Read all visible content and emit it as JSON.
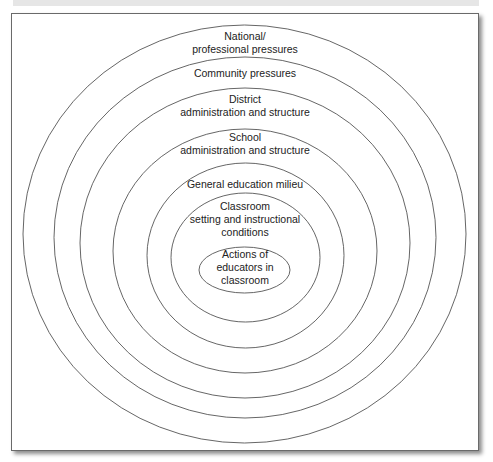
{
  "diagram": {
    "type": "nested-ellipses",
    "line_color": "#555555",
    "layers": [
      {
        "id": "national",
        "lines": [
          "National/",
          "professional pressures"
        ],
        "cx": 244.5,
        "cy": 234,
        "rx": 221.5,
        "ry": 209,
        "label_top": 30
      },
      {
        "id": "community",
        "lines": [
          "Community pressures"
        ],
        "cx": 245,
        "cy": 237.5,
        "rx": 191,
        "ry": 180.5,
        "label_top": 67
      },
      {
        "id": "district",
        "lines": [
          "District",
          "administration and structure"
        ],
        "cx": 245,
        "cy": 243,
        "rx": 165,
        "ry": 155,
        "label_top": 93
      },
      {
        "id": "school",
        "lines": [
          "School",
          "administration and structure"
        ],
        "cx": 245,
        "cy": 251,
        "rx": 132,
        "ry": 122,
        "label_top": 131
      },
      {
        "id": "milieu",
        "lines": [
          "General education milieu"
        ],
        "cx": 245.5,
        "cy": 255.5,
        "rx": 98.5,
        "ry": 92.5,
        "label_top": 178
      },
      {
        "id": "classroom",
        "lines": [
          "Classroom",
          "setting and instructional",
          "conditions"
        ],
        "cx": 245.5,
        "cy": 257.5,
        "rx": 74.5,
        "ry": 64.5,
        "label_top": 200
      },
      {
        "id": "actions",
        "lines": [
          "Actions of",
          "educators in",
          "classroom"
        ],
        "cx": 244.5,
        "cy": 270,
        "rx": 45.5,
        "ry": 23,
        "label_top": 247
      }
    ]
  },
  "labels": {
    "national_1": "National/",
    "national_2": "professional pressures",
    "community": "Community pressures",
    "district_1": "District",
    "district_2": "administration and structure",
    "school_1": "School",
    "school_2": "administration and structure",
    "milieu": "General education milieu",
    "classroom_1": "Classroom",
    "classroom_2": "setting and instructional",
    "classroom_3": "conditions",
    "actions_1": "Actions of",
    "actions_2": "educators in",
    "actions_3": "classroom"
  }
}
